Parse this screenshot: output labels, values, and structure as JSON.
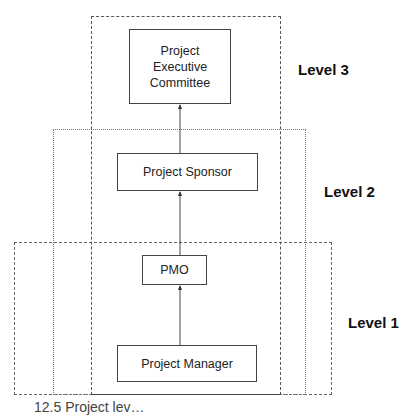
{
  "diagram": {
    "regions": [
      {
        "id": "level-3",
        "label": "Level 3",
        "style": "dashed"
      },
      {
        "id": "level-2",
        "label": "Level 2",
        "style": "dotted"
      },
      {
        "id": "level-1",
        "label": "Level 1",
        "style": "dashed"
      }
    ],
    "nodes": [
      {
        "id": "exec",
        "lines": [
          "Project",
          "Executive",
          "Committee"
        ]
      },
      {
        "id": "sponsor",
        "label": "Project Sponsor"
      },
      {
        "id": "pmo",
        "label": "PMO"
      },
      {
        "id": "manager",
        "label": "Project Manager"
      }
    ],
    "edges": [
      {
        "from": "manager",
        "to": "pmo"
      },
      {
        "from": "pmo",
        "to": "sponsor"
      },
      {
        "from": "sponsor",
        "to": "exec"
      }
    ],
    "caption_partial": "12.5 Project lev…"
  }
}
